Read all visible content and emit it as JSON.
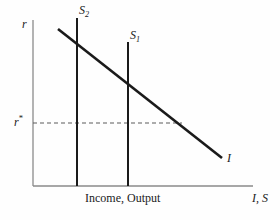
{
  "figure": {
    "title": "",
    "background_color": "#fefefe",
    "ink_color": "#1a1a1a",
    "axis_color": "#8a8a8a"
  },
  "labels": {
    "y_axis": "r",
    "y_axis_name": "interest rate",
    "equilibrium_rate": "r",
    "equilibrium_rate_sup": "*",
    "x_axis_caption": "Income, Output",
    "x_axis_symbols_main": "I",
    "x_axis_symbols_sep": ", ",
    "x_axis_symbols_second": "S",
    "investment_curve": "I",
    "saving_curve_1_main": "S",
    "saving_curve_1_sub": "1",
    "saving_curve_2_main": "S",
    "saving_curve_2_sub": "2"
  },
  "chart_data": {
    "type": "line",
    "title": "",
    "xlabel": "Income, Output",
    "ylabel": "r",
    "xlim": [
      0,
      100
    ],
    "ylim": [
      0,
      100
    ],
    "grid": false,
    "legend": "none",
    "axes": {
      "x_axis_symbols": "I, S",
      "y_axis_symbol": "r",
      "origin_px": [
        33,
        186
      ],
      "x_axis_end_px": [
        253,
        186
      ],
      "y_axis_top_px": [
        33,
        20
      ]
    },
    "series": [
      {
        "name": "I",
        "label": "I",
        "type": "line",
        "description": "downward-sloping investment demand curve",
        "points_px": [
          [
            58,
            29
          ],
          [
            222,
            158
          ]
        ],
        "x": [
          15,
          86
        ],
        "y": [
          94,
          17
        ],
        "stroke_width": 2.6
      },
      {
        "name": "S2",
        "label": "S2",
        "type": "vertical-line",
        "description": "vertical saving schedule, lower income level",
        "points_px": [
          [
            77,
            18
          ],
          [
            77,
            186
          ]
        ],
        "x": [
          20,
          20
        ],
        "y": [
          100,
          0
        ],
        "stroke_width": 2.0
      },
      {
        "name": "S1",
        "label": "S1",
        "type": "vertical-line",
        "description": "vertical saving schedule, higher income level",
        "points_px": [
          [
            128,
            42
          ],
          [
            128,
            186
          ]
        ],
        "x": [
          43,
          43
        ],
        "y": [
          86,
          0
        ],
        "stroke_width": 2.0
      },
      {
        "name": "r*",
        "label": "r*",
        "type": "dashed-horizontal-line",
        "description": "equilibrium interest rate reference line",
        "points_px": [
          [
            33,
            123
          ],
          [
            182,
            123
          ]
        ],
        "x": [
          0,
          68
        ],
        "y": [
          38,
          38
        ],
        "stroke_width": 1.1,
        "dash": "4,3"
      }
    ],
    "annotations": [
      {
        "text": "r",
        "px": [
          26,
          24
        ],
        "role": "y-axis-title"
      },
      {
        "text": "r*",
        "px": [
          18,
          120
        ],
        "role": "equilibrium-level"
      },
      {
        "text": "S2",
        "px": [
          83,
          10
        ],
        "role": "curve-label"
      },
      {
        "text": "S1",
        "px": [
          134,
          35
        ],
        "role": "curve-label"
      },
      {
        "text": "I",
        "px": [
          230,
          158
        ],
        "role": "curve-label"
      },
      {
        "text": "Income, Output",
        "px": [
          85,
          198
        ],
        "role": "x-axis-caption"
      },
      {
        "text": "I, S",
        "px": [
          255,
          198
        ],
        "role": "x-axis-symbols"
      }
    ]
  }
}
